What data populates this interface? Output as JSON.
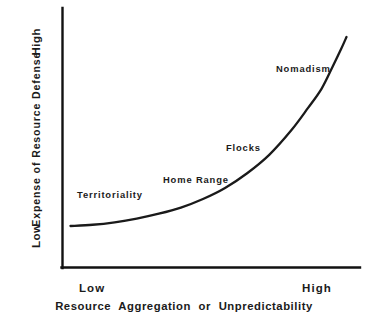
{
  "chart_data": {
    "type": "line",
    "title": "",
    "subtitle": "",
    "xlabel": "Resource  Aggregation  or  Unpredictability",
    "ylabel": "Expense  of  Resource  Defense",
    "xtick_labels": [
      "Low",
      "High"
    ],
    "ytick_labels": [
      "Low",
      "High"
    ],
    "xlim": [
      0,
      1
    ],
    "ylim": [
      0,
      1
    ],
    "grid": false,
    "legend": "none",
    "axis_style": "open (left and bottom spines only)",
    "series": [
      {
        "name": "Expense of resource defense vs resource aggregation",
        "x": [
          0.0,
          0.08,
          0.16,
          0.24,
          0.32,
          0.4,
          0.48,
          0.56,
          0.64,
          0.72,
          0.8,
          0.86,
          0.91,
          0.95,
          0.98,
          1.0
        ],
        "y": [
          0.16,
          0.165,
          0.175,
          0.19,
          0.21,
          0.235,
          0.27,
          0.315,
          0.375,
          0.45,
          0.55,
          0.64,
          0.72,
          0.81,
          0.88,
          0.93
        ]
      }
    ],
    "annotations": [
      {
        "text": "Territoriality",
        "x": 0.06,
        "y": 0.29
      },
      {
        "text": "Home Range",
        "x": 0.35,
        "y": 0.35
      },
      {
        "text": "Flocks",
        "x": 0.58,
        "y": 0.48
      },
      {
        "text": "Nomadism",
        "x": 0.75,
        "y": 0.78
      }
    ],
    "colors": {
      "background": "#ffffff",
      "axis": "#111111",
      "curve": "#1a1a1a",
      "text": "#1b1b1b"
    }
  }
}
